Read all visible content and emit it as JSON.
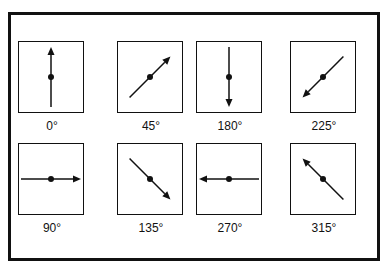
{
  "diagram": {
    "title": "",
    "panels": [
      {
        "label": "0°",
        "angle": 0,
        "row": 0,
        "col": 0
      },
      {
        "label": "45°",
        "angle": 45,
        "row": 0,
        "col": 1
      },
      {
        "label": "180°",
        "angle": 180,
        "row": 0,
        "col": 2
      },
      {
        "label": "225°",
        "angle": 225,
        "row": 0,
        "col": 3
      },
      {
        "label": "90°",
        "angle": 90,
        "row": 1,
        "col": 0
      },
      {
        "label": "135°",
        "angle": 135,
        "row": 1,
        "col": 1
      },
      {
        "label": "270°",
        "angle": 270,
        "row": 1,
        "col": 2
      },
      {
        "label": "315°",
        "angle": 315,
        "row": 1,
        "col": 3
      }
    ]
  }
}
